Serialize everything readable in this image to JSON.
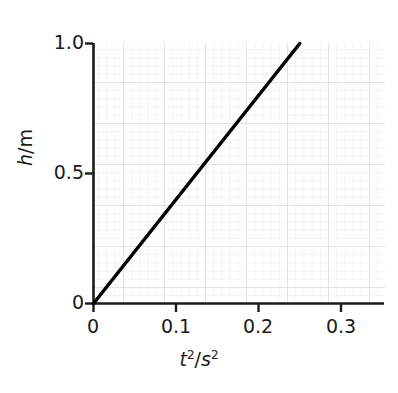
{
  "chart_data": {
    "type": "line",
    "title": "",
    "subtitle": "",
    "xlabel": "t^2/s^2",
    "xlabel_parts": {
      "symbol": "t",
      "exponent": "2",
      "separator": "/",
      "unit": "s",
      "unit_exponent": "2"
    },
    "ylabel": "h/m",
    "ylabel_parts": {
      "symbol": "h",
      "separator": "/",
      "unit": "m"
    },
    "xlim": [
      0,
      0.35
    ],
    "ylim": [
      0,
      1.0
    ],
    "xticks": [
      0,
      0.1,
      0.2,
      0.3
    ],
    "xticklabels": [
      "0",
      "0.1",
      "0.2",
      "0.3"
    ],
    "yticks": [
      0,
      0.5,
      1.0
    ],
    "yticklabels": [
      "0",
      "0.5",
      "1.0"
    ],
    "grid": true,
    "grid_style": "graph-paper",
    "grid_major_step_x": 0.05,
    "grid_minor_step_x": 0.01,
    "grid_major_step_y": 0.1667,
    "grid_minor_step_y": 0.0333,
    "legend": null,
    "legend_position": "none",
    "series": [
      {
        "name": "h vs t^2",
        "style": "solid",
        "color": "#000000",
        "linewidth": 3.5,
        "x": [
          0,
          0.25
        ],
        "y": [
          0,
          1.0
        ],
        "slope": 4.0,
        "intercept": 0
      }
    ],
    "annotations": []
  },
  "colors": {
    "background": "#ffffff",
    "axis": "#1a1a1a",
    "text": "#1a1a1a",
    "grid_major": "#d8d8dc",
    "grid_minor": "#ececf0",
    "line": "#000000"
  },
  "ticks": {
    "y": [
      {
        "label": "1.0",
        "value": 1.0
      },
      {
        "label": "0.5",
        "value": 0.5
      },
      {
        "label": "0",
        "value": 0
      }
    ],
    "x": [
      {
        "label": "0",
        "value": 0
      },
      {
        "label": "0.1",
        "value": 0.1
      },
      {
        "label": "0.2",
        "value": 0.2
      },
      {
        "label": "0.3",
        "value": 0.3
      }
    ]
  }
}
